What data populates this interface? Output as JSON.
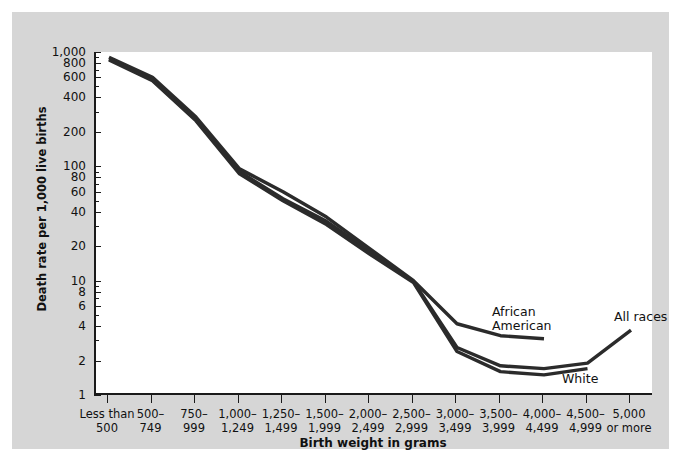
{
  "chart_data": {
    "type": "line",
    "title": "",
    "xlabel": "Birth weight in grams",
    "ylabel": "Death rate per 1,000 live births",
    "yscale": "log",
    "ylim": [
      1,
      1000
    ],
    "grid": false,
    "legend_position": "inline-annotations",
    "categories": [
      "Less than 500",
      "500–749",
      "750–999",
      "1,000–1,249",
      "1,250–1,499",
      "1,500–1,999",
      "2,000–2,499",
      "2,500–2,999",
      "3,000–3,499",
      "3,500–3,999",
      "4,000–4,499",
      "4,500–4,999",
      "5,000 or more"
    ],
    "category_lines": [
      [
        "Less than",
        "500"
      ],
      [
        "500–",
        "749"
      ],
      [
        "750–",
        "999"
      ],
      [
        "1,000–",
        "1,249"
      ],
      [
        "1,250–",
        "1,499"
      ],
      [
        "1,500–",
        "1,999"
      ],
      [
        "2,000–",
        "2,499"
      ],
      [
        "2,500–",
        "2,999"
      ],
      [
        "3,000–",
        "3,499"
      ],
      [
        "3,500–",
        "3,999"
      ],
      [
        "4,000–",
        "4,499"
      ],
      [
        "4,500–",
        "4,999"
      ],
      [
        "5,000",
        "or more"
      ]
    ],
    "y_ticks": [
      1000,
      800,
      600,
      400,
      200,
      100,
      80,
      60,
      40,
      20,
      10,
      8,
      6,
      4,
      2,
      1
    ],
    "y_tick_labels": [
      "1,000",
      "800",
      "600",
      "400",
      "200",
      "100",
      "80",
      "60",
      "40",
      "20",
      "10",
      "8",
      "6",
      "4",
      "2",
      "1"
    ],
    "series": [
      {
        "name": "African American",
        "color": "#2b2b2b",
        "values": [
          900,
          600,
          270,
          95,
          60,
          36,
          19,
          10.0,
          4.2,
          3.3,
          3.1,
          null,
          null
        ]
      },
      {
        "name": "All races",
        "color": "#2b2b2b",
        "values": [
          870,
          570,
          255,
          90,
          52,
          33,
          18,
          9.8,
          2.6,
          1.8,
          1.7,
          1.9,
          3.7
        ]
      },
      {
        "name": "White",
        "color": "#2b2b2b",
        "values": [
          850,
          560,
          250,
          86,
          50,
          31,
          17,
          9.6,
          2.4,
          1.6,
          1.5,
          1.7,
          null
        ]
      }
    ],
    "annotations": [
      {
        "name": "african-american",
        "lines": [
          "African",
          "American"
        ]
      },
      {
        "name": "all-races",
        "lines": [
          "All races"
        ]
      },
      {
        "name": "white",
        "lines": [
          "White"
        ]
      }
    ]
  },
  "colors": {
    "panel_background": "#d6d6d6",
    "plot_background": "#ffffff",
    "axis": "#1a1a1a",
    "line": "#2b2b2b",
    "text": "#111111"
  }
}
